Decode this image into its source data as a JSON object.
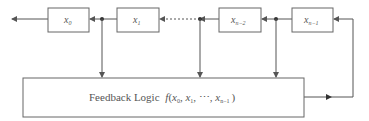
{
  "diagram": {
    "registers": [
      {
        "id": "x0",
        "base": "x",
        "sub": "0"
      },
      {
        "id": "x1",
        "base": "x",
        "sub": "1"
      },
      {
        "id": "xn2",
        "base": "x",
        "sub": "n−2"
      },
      {
        "id": "xn1",
        "base": "x",
        "sub": "n−1"
      }
    ],
    "feedback": {
      "label": "Feedback Logic",
      "func": "f",
      "args_open": "(",
      "arg0_base": "x",
      "arg0_sub": "0",
      "arg1_base": "x",
      "arg1_sub": "1",
      "ellipsis": "⋯",
      "argn_base": "x",
      "argn_sub": "n−1",
      "args_close": ")"
    },
    "colors": {
      "stroke": "#555555",
      "text": "#555555",
      "background": "#ffffff"
    }
  }
}
